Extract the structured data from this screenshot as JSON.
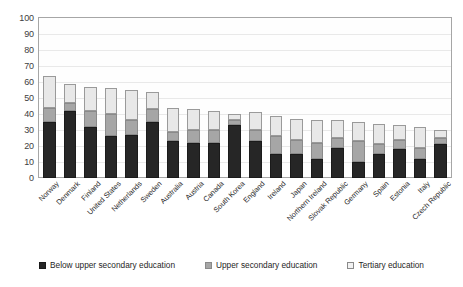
{
  "chart_data": {
    "type": "bar",
    "subtype": "stacked-vertical",
    "title": "",
    "xlabel": "",
    "ylabel": "",
    "ylim": [
      0,
      100
    ],
    "ytick_step": 10,
    "yticks": [
      100,
      90,
      80,
      70,
      60,
      50,
      40,
      30,
      20,
      10,
      0
    ],
    "grid": true,
    "grid_axis": "y",
    "legend_position": "bottom",
    "categories": [
      "Norway",
      "Denmark",
      "Finland",
      "United States",
      "Netherlands",
      "Sweden",
      "Australia",
      "Austria",
      "Canada",
      "South Korea",
      "England",
      "Ireland",
      "Japan",
      "Northern Ireland",
      "Slovak Republic",
      "Germany",
      "Spain",
      "Estonia",
      "Italy",
      "Czech Republic"
    ],
    "series": [
      {
        "name": "Below upper secondary education",
        "color": "#262626",
        "values": [
          35,
          42,
          32,
          26,
          27,
          35,
          23,
          22,
          22,
          33,
          23,
          15,
          15,
          12,
          19,
          10,
          15,
          18,
          12,
          21
        ]
      },
      {
        "name": "Upper secondary education",
        "color": "#a6a6a6",
        "values": [
          9,
          5,
          10,
          14,
          9,
          8,
          6,
          8,
          8,
          3,
          7,
          11,
          9,
          10,
          6,
          13,
          6,
          6,
          7,
          4
        ]
      },
      {
        "name": "Tertiary education",
        "color": "#e8e8e8",
        "values": [
          20,
          12,
          15,
          16,
          19,
          11,
          15,
          13,
          12,
          4,
          11,
          13,
          13,
          14,
          11,
          12,
          13,
          9,
          13,
          5
        ]
      }
    ],
    "totals": [
      64,
      59,
      57,
      56,
      55,
      54,
      44,
      43,
      42,
      40,
      41,
      39,
      37,
      36,
      36,
      35,
      34,
      33,
      32,
      30
    ]
  },
  "legend": {
    "items": [
      {
        "label": "Below upper secondary education",
        "swatch": "legend-swatch-dark"
      },
      {
        "label": "Upper secondary education",
        "swatch": "legend-swatch-gray"
      },
      {
        "label": "Tertiary education",
        "swatch": "legend-swatch-light"
      }
    ]
  }
}
